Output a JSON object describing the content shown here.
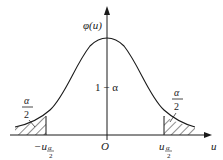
{
  "diagram": {
    "type": "normal-distribution-two-tailed",
    "y_axis_label": "φ(u)",
    "x_axis_label": "u",
    "origin_label": "O",
    "center_area_label": "1 − α",
    "left_tail": {
      "area_numerator": "α",
      "area_denominator": "2",
      "cut_label_prefix": "−u",
      "cut_label_subscript_num": "α",
      "cut_label_subscript_den": "2"
    },
    "right_tail": {
      "area_numerator": "α",
      "area_denominator": "2",
      "cut_label_prefix": "u",
      "cut_label_subscript_num": "α",
      "cut_label_subscript_den": "2"
    },
    "colors": {
      "line": "#1a1a1a",
      "background": "#ffffff"
    }
  }
}
